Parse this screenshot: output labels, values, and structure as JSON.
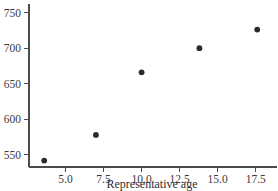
{
  "chart_data": {
    "type": "scatter",
    "title": "",
    "xlabel": "Representative age",
    "ylabel": "",
    "xlim": [
      2.6,
      18.9
    ],
    "ylim": [
      533,
      762
    ],
    "grid": false,
    "legend": null,
    "x_ticks": [
      5.0,
      7.5,
      10.0,
      12.5,
      15.0,
      17.5
    ],
    "x_tick_labels": [
      "5.0",
      "7.5",
      "10.0",
      "12.5",
      "15.0",
      "17.5"
    ],
    "y_ticks": [
      550,
      600,
      650,
      700,
      750
    ],
    "y_tick_labels": [
      "550",
      "600",
      "650",
      "700",
      "750"
    ],
    "series": [
      {
        "name": "observations",
        "marker": "filled-circle",
        "color": "#2b2b2b",
        "points": [
          {
            "x": 3.6,
            "y": 542
          },
          {
            "x": 7.0,
            "y": 578
          },
          {
            "x": 10.0,
            "y": 666
          },
          {
            "x": 13.8,
            "y": 700
          },
          {
            "x": 17.6,
            "y": 726
          }
        ]
      }
    ]
  },
  "axes": {
    "x_axis_name": "Representative age",
    "y_axis_name": ""
  }
}
